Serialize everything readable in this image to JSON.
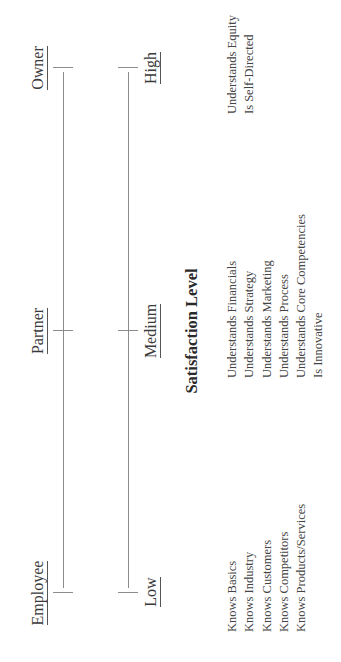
{
  "roles_axis": {
    "labels": [
      "Employee",
      "Partner",
      "Owner"
    ]
  },
  "satisfaction_axis": {
    "labels": [
      "Low",
      "Medium",
      "High"
    ],
    "title": "Satisfaction Level"
  },
  "colors": {
    "line": "#8c8c8c",
    "text": "#3a3a3a"
  },
  "attributes": {
    "employee": [
      "Knows Basics",
      "Knows Industry",
      "Knows Customers",
      "Knows Competitors",
      "Knows Products/Services"
    ],
    "partner": [
      "Understands Financials",
      "Understands Strategy",
      "Understands Marketing",
      "Understands Process",
      "Understands Core Competencies",
      "Is Innovative"
    ],
    "owner": [
      "Understands Equity",
      "Is Self-Directed"
    ]
  }
}
